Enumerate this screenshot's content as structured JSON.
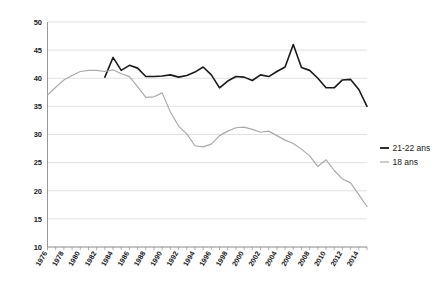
{
  "chart_data": {
    "type": "line",
    "title": "",
    "subtitle": "",
    "xlabel": "",
    "ylabel": "",
    "grid": true,
    "legend_position": "right",
    "ylim": [
      10,
      50
    ],
    "ytick_step": 5,
    "ytick_labels": [
      "10",
      "15",
      "20",
      "25",
      "30",
      "35",
      "40",
      "45",
      "50"
    ],
    "xlim": [
      1976,
      2015
    ],
    "xtick_step": 1,
    "xtick_labels": [
      "1976",
      "1978",
      "1980",
      "1982",
      "1984",
      "1986",
      "1988",
      "1990",
      "1992",
      "1994",
      "1996",
      "1998",
      "2000",
      "2002",
      "2004",
      "2006",
      "2008",
      "2010",
      "2012",
      "2014"
    ],
    "xtick_label_years": [
      1976,
      1978,
      1980,
      1982,
      1984,
      1986,
      1988,
      1990,
      1992,
      1994,
      1996,
      1998,
      2000,
      2002,
      2004,
      2006,
      2008,
      2010,
      2012,
      2014
    ],
    "xtick_label_rotation": -60,
    "series": [
      {
        "name": "21-22 ans",
        "color": "#1a1a1a",
        "width": 1.6,
        "x": [
          1983,
          1984,
          1985,
          1986,
          1987,
          1988,
          1989,
          1990,
          1991,
          1992,
          1993,
          1994,
          1995,
          1996,
          1997,
          1998,
          1999,
          2000,
          2001,
          2002,
          2003,
          2004,
          2005,
          2006,
          2007,
          2008,
          2009,
          2010,
          2011,
          2012,
          2013,
          2014,
          2015
        ],
        "values": [
          40.2,
          43.7,
          41.4,
          42.3,
          41.8,
          40.3,
          40.3,
          40.4,
          40.6,
          40.2,
          40.5,
          41.1,
          42.0,
          40.6,
          38.3,
          39.5,
          40.3,
          40.2,
          39.6,
          40.6,
          40.3,
          41.2,
          42.0,
          46.0,
          41.9,
          41.4,
          40.0,
          38.3,
          38.3,
          39.7,
          39.8,
          38.0,
          35.0
        ]
      },
      {
        "name": "18 ans",
        "color": "#aaaaaa",
        "width": 1.2,
        "x": [
          1976,
          1977,
          1978,
          1979,
          1980,
          1981,
          1982,
          1983,
          1984,
          1985,
          1986,
          1987,
          1988,
          1989,
          1990,
          1991,
          1992,
          1993,
          1994,
          1995,
          1996,
          1997,
          1998,
          1999,
          2000,
          2001,
          2002,
          2003,
          2004,
          2005,
          2006,
          2007,
          2008,
          2009,
          2010,
          2011,
          2012,
          2013,
          2014,
          2015
        ],
        "values": [
          37.0,
          38.4,
          39.7,
          40.5,
          41.2,
          41.4,
          41.4,
          41.2,
          41.5,
          40.8,
          40.3,
          38.5,
          36.6,
          36.7,
          37.4,
          34.0,
          31.5,
          30.1,
          28.0,
          27.8,
          28.3,
          29.8,
          30.6,
          31.2,
          31.3,
          30.9,
          30.4,
          30.6,
          29.8,
          29.0,
          28.4,
          27.4,
          26.2,
          24.3,
          25.5,
          23.6,
          22.1,
          21.4,
          19.3,
          17.2
        ]
      }
    ],
    "legend": [
      {
        "label": "21-22 ans",
        "color": "#1a1a1a",
        "marker": "line"
      },
      {
        "label": "18 ans",
        "color": "#aaaaaa",
        "marker": "line"
      }
    ]
  }
}
